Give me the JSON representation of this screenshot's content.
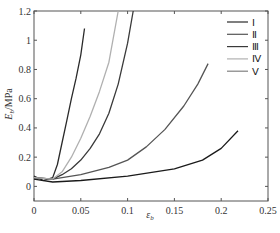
{
  "chart_data": {
    "type": "line",
    "title": "",
    "xlabel": "ε_b",
    "ylabel": "E_b/MPa",
    "xlim": [
      0,
      0.25
    ],
    "ylim": [
      -0.1,
      1.2
    ],
    "xticks": [
      0,
      0.05,
      0.1,
      0.15,
      0.2,
      0.25
    ],
    "xtick_labels": [
      "0",
      "0.05",
      "0.1",
      "0.15",
      "0.2",
      "0.25"
    ],
    "yticks": [
      0,
      0.2,
      0.4,
      0.6,
      0.8,
      1.0,
      1.2
    ],
    "ytick_labels": [
      "0",
      "0.2",
      "0.4",
      "0.6",
      "0.8",
      "1",
      "1.2"
    ],
    "grid": false,
    "legend_position": "upper right",
    "series": [
      {
        "name": "Ⅰ",
        "color": "#2a2a2a",
        "x": [
          0,
          0.01,
          0.02,
          0.025,
          0.03,
          0.035,
          0.04,
          0.045,
          0.05,
          0.054
        ],
        "y": [
          0.07,
          0.04,
          0.06,
          0.15,
          0.3,
          0.45,
          0.6,
          0.74,
          0.9,
          1.08
        ]
      },
      {
        "name": "Ⅱ",
        "color": "#555555",
        "x": [
          0,
          0.02,
          0.05,
          0.08,
          0.1,
          0.12,
          0.14,
          0.16,
          0.175,
          0.186
        ],
        "y": [
          0.06,
          0.05,
          0.08,
          0.13,
          0.18,
          0.27,
          0.39,
          0.55,
          0.7,
          0.84
        ]
      },
      {
        "name": "Ⅲ",
        "color": "#3a3a3a",
        "x": [
          0,
          0.02,
          0.03,
          0.04,
          0.05,
          0.06,
          0.07,
          0.08,
          0.09,
          0.1,
          0.106
        ],
        "y": [
          0.06,
          0.05,
          0.08,
          0.12,
          0.18,
          0.26,
          0.36,
          0.5,
          0.7,
          0.98,
          1.2
        ]
      },
      {
        "name": "Ⅳ",
        "color": "#b0b0b0",
        "x": [
          0,
          0.02,
          0.03,
          0.04,
          0.05,
          0.06,
          0.07,
          0.08,
          0.09
        ],
        "y": [
          0.06,
          0.05,
          0.1,
          0.2,
          0.33,
          0.48,
          0.65,
          0.85,
          1.2
        ]
      },
      {
        "name": "Ⅴ",
        "color": "#1a1a1a",
        "x": [
          0,
          0.02,
          0.05,
          0.1,
          0.15,
          0.18,
          0.2,
          0.218
        ],
        "y": [
          0.05,
          0.03,
          0.04,
          0.07,
          0.12,
          0.18,
          0.26,
          0.38
        ]
      }
    ],
    "legend_colors": [
      "#2a2a2a",
      "#555555",
      "#3a3a3a",
      "#b0b0b0",
      "#808080"
    ]
  }
}
